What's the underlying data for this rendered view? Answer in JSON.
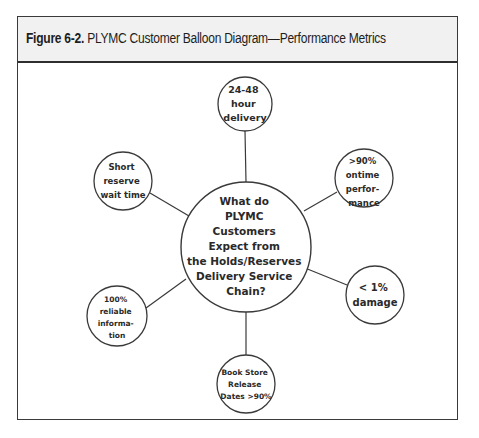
{
  "figure": {
    "label": "Figure 6-2.",
    "title": "PLYMC Customer Balloon Diagram—Performance Metrics"
  },
  "diagram": {
    "center": {
      "lines": [
        "What do",
        "PLYMC",
        "Customers",
        "Expect from",
        "the Holds/Reserves",
        "Delivery Service",
        "Chain?"
      ]
    },
    "balloons": [
      {
        "id": "delivery",
        "lines": [
          "24-48",
          "hour",
          "delivery"
        ]
      },
      {
        "id": "ontime",
        "lines": [
          ">90%",
          "ontime",
          "perfor-",
          "mance"
        ]
      },
      {
        "id": "damage",
        "lines": [
          "< 1%",
          "damage"
        ]
      },
      {
        "id": "bookstore",
        "lines": [
          "Book Store",
          "Release",
          "Dates >90%"
        ]
      },
      {
        "id": "reliable",
        "lines": [
          "100%",
          "reliable",
          "informa-",
          "tion"
        ]
      },
      {
        "id": "reserve",
        "lines": [
          "Short",
          "reserve",
          "wait time"
        ]
      }
    ]
  },
  "colors": {
    "stroke": "#3a3a3a",
    "header_bg": "#f1f1f1",
    "text": "#2a2a2a"
  }
}
